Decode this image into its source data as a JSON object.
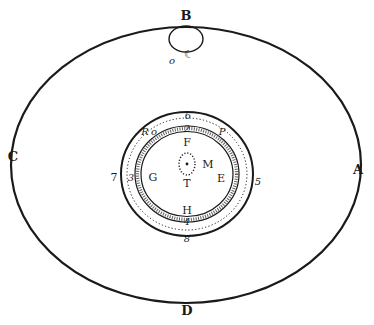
{
  "figure": {
    "type": "astronomical diagram",
    "ink_color": "#1a1a1a",
    "background": "#ffffff",
    "outer_orbit": {
      "labels": {
        "top": "B",
        "left": "C",
        "right": "A",
        "bottom": "D"
      }
    },
    "top_body": {
      "crescent_glyph": "☾",
      "small_mark": "o"
    },
    "inner_system": {
      "numeric_labels": {
        "top": "6",
        "top_inner": "2",
        "left": "7",
        "left_inner": "3",
        "right": "5",
        "bottom_inner": "4",
        "bottom": "8"
      },
      "letter_labels": {
        "top_left": "R",
        "top_left_mark": "o",
        "top_right": "P",
        "top_center": "F",
        "center_right": "M",
        "center": "T",
        "left": "G",
        "right": "E",
        "bottom": "H"
      }
    }
  }
}
